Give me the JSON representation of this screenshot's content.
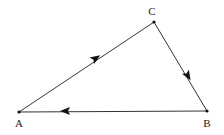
{
  "diagram": {
    "type": "directed-triangle",
    "vertices": [
      {
        "id": "A",
        "label": "A",
        "x": 19,
        "y": 112,
        "label_x": 19,
        "label_y": 127
      },
      {
        "id": "B",
        "label": "B",
        "x": 207,
        "y": 111,
        "label_x": 207,
        "label_y": 127
      },
      {
        "id": "C",
        "label": "C",
        "x": 154,
        "y": 22,
        "label_x": 152,
        "label_y": 15
      }
    ],
    "edges": [
      {
        "from": "A",
        "to": "C",
        "arrow_at": [
          96,
          58
        ]
      },
      {
        "from": "C",
        "to": "B",
        "arrow_at": [
          188,
          76
        ]
      },
      {
        "from": "B",
        "to": "A",
        "arrow_at": [
          65,
          111
        ]
      }
    ],
    "colors": {
      "line": "#333333",
      "arrow": "#111111",
      "background": "#ffffff"
    }
  }
}
